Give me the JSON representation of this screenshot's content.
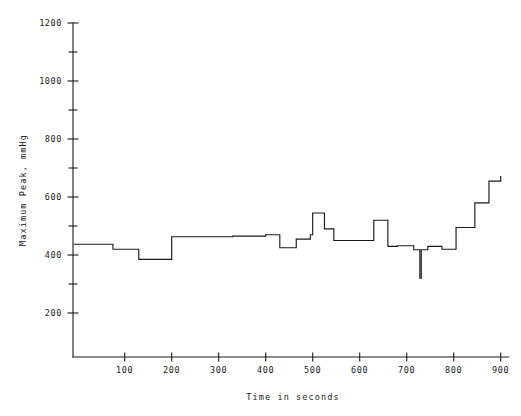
{
  "chart_data": {
    "type": "line",
    "title": "",
    "subtitle": "",
    "xlabel": "Time in seconds",
    "ylabel": "Maximum Peak, mmHg",
    "xlim": [
      -10,
      900
    ],
    "ylim": [
      100,
      1200
    ],
    "xticks": [
      100,
      200,
      300,
      400,
      500,
      600,
      700,
      800,
      900
    ],
    "xtick_labels": [
      "100",
      "200",
      "300",
      "400",
      "500",
      "600",
      "700",
      "800",
      "900"
    ],
    "yticks": [
      200,
      400,
      600,
      800,
      1000,
      1200
    ],
    "ytick_labels": [
      "200",
      "400",
      "600",
      "800",
      "1000",
      "1200"
    ],
    "yticks_minor": [
      150,
      250,
      300,
      350,
      450,
      500,
      550,
      650,
      700,
      750,
      850,
      900,
      950,
      1050,
      1100,
      1150
    ],
    "grid": false,
    "legend": false,
    "line_style": "step-post",
    "line_color": "#1a1a1a",
    "series": [
      {
        "name": "Maximum Peak",
        "x": [
          -8,
          35,
          75,
          105,
          130,
          160,
          195,
          200,
          255,
          330,
          390,
          400,
          415,
          430,
          450,
          465,
          480,
          495,
          500,
          515,
          525,
          535,
          545,
          560,
          580,
          615,
          630,
          640,
          655,
          660,
          680,
          700,
          715,
          725,
          728,
          731,
          734,
          745,
          760,
          775,
          790,
          805,
          820,
          845,
          860,
          875,
          890,
          900
        ],
        "y": [
          437,
          437,
          420,
          420,
          385,
          385,
          385,
          463,
          463,
          465,
          465,
          470,
          470,
          425,
          425,
          455,
          455,
          470,
          545,
          545,
          490,
          490,
          450,
          450,
          450,
          450,
          520,
          520,
          520,
          430,
          432,
          432,
          418,
          418,
          320,
          418,
          418,
          430,
          430,
          420,
          420,
          495,
          495,
          580,
          580,
          655,
          655,
          672
        ],
        "units": "mmHg"
      }
    ],
    "annotations": [
      {
        "label": "sharp downward spike",
        "x": 731,
        "y": 320
      },
      {
        "label": "maximum of trace",
        "x": 510,
        "y": 545
      },
      {
        "label": "minimum of plateau",
        "x": 175,
        "y": 385
      }
    ]
  },
  "figure": {
    "background_color": "#ffffff",
    "foreground_color": "#1a1a1a"
  }
}
